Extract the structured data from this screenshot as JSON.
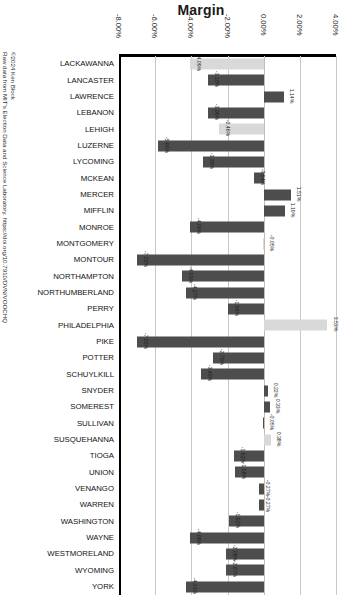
{
  "chart": {
    "title": "Margin",
    "credit_line1": "Raw data from MIT's Election Data and Science Laboratory. https://doi.org/10.7910/DVN/VOOCHQ",
    "credit_line2": "©2024 Ken Block"
  },
  "chart_data": {
    "type": "bar",
    "orientation": "horizontal",
    "title": "Margin",
    "xlabel": "Margin",
    "ylabel": "",
    "xlim": [
      -8,
      4
    ],
    "grid": true,
    "legend": false,
    "tick_labels": [
      "-8.00%",
      "-6.00%",
      "-4.00%",
      "-2.00%",
      "0.00%",
      "2.00%",
      "4.00%"
    ],
    "ticks": [
      -8,
      -6,
      -4,
      -2,
      0,
      2,
      4
    ],
    "value_suffix": "%",
    "colors": {
      "negative_bar": "#4d4d4d",
      "positive_bar": "#4d4d4d",
      "highlight_bar": "#d9d9d9",
      "gridline": "#c9c9c9",
      "axis": "#000000"
    },
    "categories": [
      "LACKAWANNA",
      "LANCASTER",
      "LAWRENCE",
      "LEBANON",
      "LEHIGH",
      "LUZERNE",
      "LYCOMING",
      "MCKEAN",
      "MERCER",
      "MIFFLIN",
      "MONROE",
      "MONTGOMERY",
      "MONTOUR",
      "NORTHAMPTON",
      "NORTHUMBERLAND",
      "PERRY",
      "PHILADELPHIA",
      "PIKE",
      "POTTER",
      "SCHUYLKILL",
      "SNYDER",
      "SOMEREST",
      "SULLIVAN",
      "SUSQUEHANNA",
      "TIOGA",
      "UNION",
      "VENANGO",
      "WARREN",
      "WASHINGTON",
      "WAYNE",
      "WESTMORELAND",
      "WYOMING",
      "YORK"
    ],
    "values": [
      -4.09,
      -3.1,
      1.14,
      -3.06,
      -2.46,
      -5.85,
      -3.38,
      -0.54,
      1.51,
      1.19,
      -4.09,
      -0.05,
      -7.02,
      -4.53,
      -4.27,
      -1.95,
      3.53,
      -7.02,
      -2.79,
      -3.45,
      0.22,
      0.33,
      -0.05,
      0.38,
      -1.62,
      -1.58,
      -0.27,
      -0.27,
      -1.92,
      -4.08,
      -2.08,
      -2.07,
      -4.31
    ],
    "value_labels": [
      "-4.09%",
      "-3.10%",
      "1.14%",
      "-3.06%",
      "-2.46%",
      "-5.85%",
      "-3.38%",
      "-0.54%",
      "1.51%",
      "1.19%",
      "-4.09%",
      "-0.05%",
      "-7.02%",
      "-4.53%",
      "-4.27%",
      "-1.95%",
      "3.53%",
      "-7.02%",
      "-2.79%",
      "-3.45%",
      "0.22%",
      "0.33%",
      "-0.05%",
      "0.38%",
      "-1.62%",
      "-1.58%",
      "-0.27%",
      "-0.27%",
      "-1.92%",
      "-4.08%",
      "-2.08%",
      "-2.07%",
      "-4.31%"
    ],
    "bar_styles": [
      "light",
      "dark",
      "dark",
      "dark",
      "light",
      "dark",
      "dark",
      "dark",
      "dark",
      "dark",
      "dark",
      "light",
      "dark",
      "dark",
      "dark",
      "dark",
      "light",
      "dark",
      "dark",
      "dark",
      "dark",
      "dark",
      "dark",
      "light",
      "dark",
      "dark",
      "dark",
      "dark",
      "dark",
      "dark",
      "dark",
      "dark",
      "dark"
    ]
  }
}
